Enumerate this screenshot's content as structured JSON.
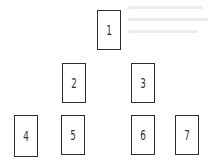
{
  "diagram": {
    "type": "tree",
    "nodes": [
      {
        "id": "1",
        "label": "1",
        "x": 97,
        "y": 10
      },
      {
        "id": "2",
        "label": "2",
        "x": 62,
        "y": 63
      },
      {
        "id": "3",
        "label": "3",
        "x": 131,
        "y": 63
      },
      {
        "id": "4",
        "label": "4",
        "x": 14,
        "y": 115
      },
      {
        "id": "5",
        "label": "5",
        "x": 61,
        "y": 115
      },
      {
        "id": "6",
        "label": "6",
        "x": 131,
        "y": 115
      },
      {
        "id": "7",
        "label": "7",
        "x": 175,
        "y": 115
      }
    ],
    "edges": [],
    "colors": {
      "border": "#2e2e2e",
      "text": "#333333",
      "background": "#ffffff"
    }
  }
}
